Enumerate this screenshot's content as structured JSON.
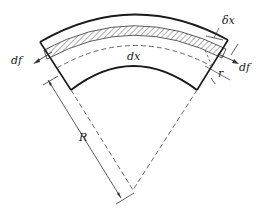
{
  "diagram": {
    "labels": {
      "df_left": "df",
      "df_right": "df",
      "dx": "dx",
      "delta_x": "δx",
      "r": "r",
      "R": "R"
    },
    "colors": {
      "stroke": "#1a1a1a",
      "dashed": "#555555",
      "background": "#ffffff"
    }
  }
}
